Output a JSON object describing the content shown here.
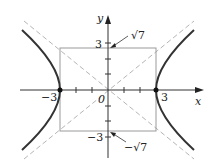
{
  "diagram": {
    "type": "hyperbola",
    "equation_hint": "x^2/9 - y^2/7 = 1",
    "axes": {
      "x_label": "x",
      "y_label": "y",
      "origin_label": "0"
    },
    "x_tick_labels": {
      "neg": "−3",
      "pos": "3"
    },
    "y_tick_labels": {
      "pos": "3",
      "neg": "−3"
    },
    "annotations": {
      "top": "√7",
      "bottom": "−√7"
    },
    "vertices": [
      [
        -3,
        0
      ],
      [
        3,
        0
      ]
    ],
    "box": {
      "a": 3,
      "b_label": "√7"
    },
    "colors": {
      "curve": "#333333",
      "box": "#9a9a9a",
      "asymptote": "#b0b0b0",
      "axis": "#333333"
    }
  }
}
